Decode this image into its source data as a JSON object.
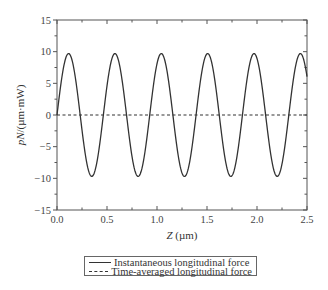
{
  "chart_data": {
    "type": "line",
    "title": "",
    "xlabel": "Z (µm)",
    "xlabel_italic_part": "Z",
    "xlabel_unit": "(µm)",
    "ylabel": "pN/(µm·mW)",
    "ylabel_italic_part": "pN",
    "ylabel_rest": "/(µm·mW)",
    "xlim": [
      0.0,
      2.5
    ],
    "ylim": [
      -15,
      15
    ],
    "xticks": [
      0.0,
      0.5,
      1.0,
      1.5,
      2.0,
      2.5
    ],
    "xtick_labels": [
      "0.0",
      "0.5",
      "1.0",
      "1.5",
      "2.0",
      "2.5"
    ],
    "yticks": [
      -15,
      -10,
      -5,
      0,
      5,
      10,
      15
    ],
    "ytick_labels": [
      "−15",
      "−10",
      "−5",
      "0",
      "5",
      "10",
      "15"
    ],
    "grid": false,
    "legend_position": "below",
    "series": [
      {
        "name": "Instantaneous longitudinal force",
        "style": "solid",
        "function": "9.7*sin(2*pi*Z/0.4636)",
        "amplitude": 9.7,
        "period": 0.4636,
        "x": [
          0.0,
          0.116,
          0.232,
          0.348,
          0.464,
          0.58,
          0.696,
          0.812,
          0.928,
          1.044,
          1.16,
          1.276,
          1.392,
          1.508,
          1.624,
          1.74,
          1.856,
          1.972,
          2.088,
          2.204,
          2.32,
          2.436,
          2.5
        ],
        "values": [
          0.0,
          9.7,
          0.0,
          -9.7,
          0.0,
          9.7,
          0.0,
          -9.7,
          0.0,
          9.7,
          0.0,
          -9.7,
          0.0,
          9.7,
          0.0,
          -9.7,
          0.0,
          9.7,
          0.0,
          -9.7,
          0.0,
          9.7,
          6.6
        ]
      },
      {
        "name": "Time-averaged longitudinal force",
        "style": "dashed",
        "x": [
          0.0,
          2.5
        ],
        "values": [
          0,
          0
        ]
      }
    ]
  },
  "legend": {
    "items": [
      {
        "label": "Instantaneous longitudinal force",
        "style": "solid"
      },
      {
        "label": "Time-averaged longitudinal force",
        "style": "dashed"
      }
    ]
  }
}
